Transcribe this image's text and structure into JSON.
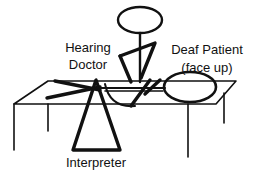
{
  "diagram": {
    "labels": {
      "doctor_line1": "Hearing",
      "doctor_line2": "Doctor",
      "patient_line1": "Deaf Patient",
      "patient_line2": "(face up)",
      "interpreter": "Interpreter"
    },
    "figures": [
      {
        "role": "doctor",
        "description": "stick figure standing behind table"
      },
      {
        "role": "patient",
        "description": "figure lying face up on table"
      },
      {
        "role": "interpreter",
        "description": "triangle figure in front of table"
      }
    ],
    "colors": {
      "ink": "#111111",
      "background": "#ffffff"
    }
  }
}
